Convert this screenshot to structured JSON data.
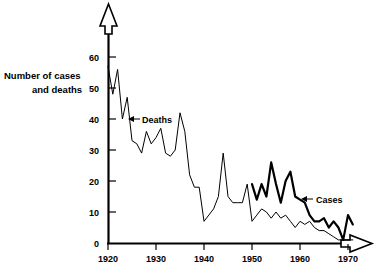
{
  "chart_data": {
    "type": "line",
    "title": "",
    "xlabel": "",
    "ylabel": "Number of cases\nand deaths",
    "ylabel_line1": "Number of cases",
    "ylabel_line2": "and deaths",
    "xlim": [
      1920,
      1972
    ],
    "ylim": [
      0,
      65
    ],
    "grid": false,
    "legend_position": "inline-annotations",
    "xticks": [
      1920,
      1930,
      1940,
      1950,
      1960,
      1970
    ],
    "xtick_labels": [
      "1920",
      "1930",
      "1940",
      "1950",
      "1960",
      "1970"
    ],
    "yticks": [
      0,
      10,
      20,
      30,
      40,
      50,
      60
    ],
    "ytick_labels": [
      "0",
      "10",
      "20",
      "30",
      "40",
      "50",
      "60"
    ],
    "annotations": [
      {
        "text": "Deaths",
        "series": "Deaths",
        "x": 1925,
        "y": 42
      },
      {
        "text": "Cases",
        "series": "Cases",
        "x": 1963,
        "y": 16
      }
    ],
    "series": [
      {
        "name": "Deaths",
        "style": "thin",
        "x": [
          1920,
          1921,
          1922,
          1923,
          1924,
          1925,
          1926,
          1927,
          1928,
          1929,
          1930,
          1931,
          1932,
          1933,
          1934,
          1935,
          1936,
          1937,
          1938,
          1939,
          1940,
          1941,
          1942,
          1943,
          1944,
          1945,
          1946,
          1947,
          1948,
          1949,
          1950,
          1951,
          1952,
          1953,
          1954,
          1955,
          1956,
          1957,
          1958,
          1959,
          1960,
          1961,
          1962,
          1963,
          1964,
          1965,
          1966,
          1967,
          1968,
          1969,
          1970,
          1971
        ],
        "values": [
          57,
          48,
          56,
          40,
          47,
          33,
          32,
          29,
          36,
          32,
          34,
          37,
          29,
          28,
          30,
          42,
          36,
          22,
          18,
          18,
          7,
          9,
          11,
          15,
          29,
          15,
          13,
          13,
          13,
          19,
          7,
          9,
          11,
          10,
          8,
          10,
          8,
          9,
          7,
          5,
          7,
          6,
          7,
          5,
          4,
          4,
          3,
          2,
          1,
          1,
          1,
          1
        ]
      },
      {
        "name": "Cases",
        "style": "thick",
        "x": [
          1950,
          1951,
          1952,
          1953,
          1954,
          1955,
          1956,
          1957,
          1958,
          1959,
          1960,
          1961,
          1962,
          1963,
          1964,
          1965,
          1966,
          1967,
          1968,
          1969,
          1970,
          1971
        ],
        "values": [
          19,
          14,
          19,
          15,
          26,
          19,
          13,
          20,
          23,
          15,
          14,
          13,
          9,
          7,
          7,
          8,
          5,
          7,
          5,
          1,
          9,
          6
        ]
      }
    ]
  }
}
